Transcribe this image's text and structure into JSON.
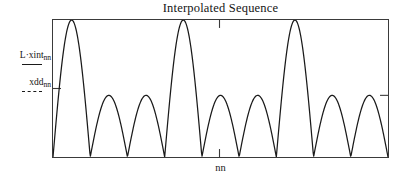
{
  "chart_data": {
    "type": "line",
    "title": "Interpolated Sequence",
    "xlabel": "nn",
    "ylabel": "",
    "grid": false,
    "legend_position": "left-outside",
    "xlim": [
      0,
      336
    ],
    "ylim": [
      0,
      1
    ],
    "axis_ticks": {
      "top_tick_x": 167,
      "bottom_tick_x": 167,
      "left_tick_y": 0.5,
      "right_tick_y": 0.45
    },
    "series": [
      {
        "name": "L·xint",
        "subscript": "nn",
        "style": "solid",
        "color": "#1a1a1a",
        "beat_period": 112,
        "carrier_humps_per_beat": 3,
        "peak_x": [
          0,
          58,
          111,
          168,
          223,
          280,
          336
        ],
        "peak_y": [
          1.0,
          0.45,
          1.0,
          0.45,
          1.0,
          0.45,
          1.0
        ],
        "trough_x": [
          29,
          85,
          140,
          196,
          252,
          308
        ],
        "trough_y": [
          0,
          0,
          0,
          0,
          0,
          0
        ]
      },
      {
        "name": "xdd",
        "subscript": "nn",
        "style": "dashed",
        "color": "#1a1a1a",
        "visible_in_plot": false
      }
    ]
  },
  "chart": {
    "title": "Interpolated Sequence",
    "xlabel": "nn"
  },
  "legend": {
    "entries": [
      {
        "name": "L·xint",
        "subscript": "nn",
        "style": "solid"
      },
      {
        "name": "xdd",
        "subscript": "nn",
        "style": "dashed"
      }
    ]
  }
}
